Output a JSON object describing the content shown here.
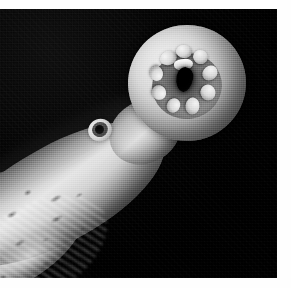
{
  "image": {
    "kind": "photograph",
    "subject": "lamprey-head-and-oral-disc",
    "color_mode": "black-and-white",
    "orientation": "head upper-right, body extending to lower-left",
    "alt_text": "Black and white photograph of a lamprey viewed head-on, showing its round sucker-like oral disc with a dark mouth opening ringed by papillae, a small eye on the side of the head, and a mottled speckled body trailing to the lower left against a black background.",
    "background_color": "#040404",
    "plate_bounds": {
      "left": 0,
      "top": 9,
      "width": 277,
      "height": 269
    },
    "margins": {
      "top": 9,
      "right": 14,
      "bottom": 10,
      "left": 0,
      "color": "#ffffff"
    }
  },
  "features": {
    "oral_disc": {
      "label": "oral disc",
      "description": "circular sucker mouth with granular fringed rim",
      "highlight_color": "#e8e7e2",
      "shadow_color": "#55544f"
    },
    "mouth_aperture": {
      "label": "mouth opening",
      "color": "#000000"
    },
    "papillae": {
      "label": "oral papillae",
      "count": 9,
      "color": "#d6d5cf"
    },
    "tooth_plate": {
      "label": "supraoral tooth plate",
      "color": "#fbfaf6"
    },
    "eye": {
      "label": "eye",
      "pupil_color": "#0b0b0b",
      "ring_color": "#4a4947"
    },
    "body": {
      "label": "body trunk",
      "texture": "mottled with dark speckles and bright ventral streaks",
      "highlight_color": "#ecebe6",
      "midtone_color": "#a9a8a4",
      "shadow_color": "#3c3b3a"
    }
  }
}
